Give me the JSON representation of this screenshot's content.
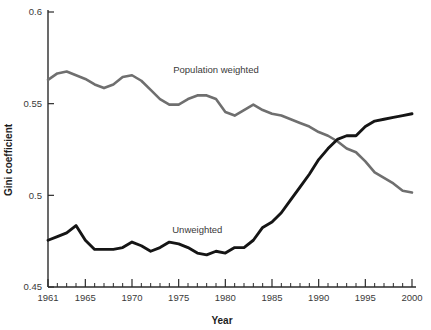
{
  "chart_data": {
    "type": "line",
    "title": "",
    "xlabel": "Year",
    "ylabel": "Gini coefficient",
    "xlim": [
      1961,
      2000
    ],
    "ylim": [
      0.45,
      0.6
    ],
    "grid": false,
    "legend_position": "inline-annotation",
    "y_ticks": [
      "0.45",
      "0.5",
      "0.55",
      "0.6"
    ],
    "y_tick_values": [
      0.45,
      0.5,
      0.55,
      0.6
    ],
    "x_ticks": [
      "1961",
      "1965",
      "1970",
      "1975",
      "1980",
      "1985",
      "1990",
      "1995",
      "2000"
    ],
    "x_tick_values": [
      1961,
      1965,
      1970,
      1975,
      1980,
      1985,
      1990,
      1995,
      2000
    ],
    "x_minor_step": 1,
    "x": [
      1961,
      1962,
      1963,
      1964,
      1965,
      1966,
      1967,
      1968,
      1969,
      1970,
      1971,
      1972,
      1973,
      1974,
      1975,
      1976,
      1977,
      1978,
      1979,
      1980,
      1981,
      1982,
      1983,
      1984,
      1985,
      1986,
      1987,
      1988,
      1989,
      1990,
      1991,
      1992,
      1993,
      1994,
      1995,
      1996,
      1997,
      1998,
      1999,
      2000
    ],
    "series": [
      {
        "name": "Population weighted",
        "color": "#6f6f6f",
        "label_x": 1979,
        "label_y": 0.5665,
        "values": [
          0.563,
          0.5665,
          0.5675,
          0.5655,
          0.5635,
          0.5605,
          0.5585,
          0.5605,
          0.5645,
          0.5655,
          0.5625,
          0.5575,
          0.5525,
          0.5495,
          0.5495,
          0.5525,
          0.5545,
          0.5545,
          0.5525,
          0.5455,
          0.5435,
          0.5465,
          0.5495,
          0.5465,
          0.5445,
          0.5435,
          0.5415,
          0.5395,
          0.5375,
          0.5345,
          0.5325,
          0.5295,
          0.5255,
          0.5235,
          0.5185,
          0.5125,
          0.5095,
          0.5065,
          0.5025,
          0.5015
        ]
      },
      {
        "name": "Unweighted",
        "color": "#151515",
        "label_x": 1977,
        "label_y": 0.4795,
        "values": [
          0.4755,
          0.4775,
          0.4795,
          0.4835,
          0.4755,
          0.4705,
          0.4705,
          0.4705,
          0.4715,
          0.4745,
          0.4725,
          0.4695,
          0.4715,
          0.4745,
          0.4735,
          0.4715,
          0.4685,
          0.4675,
          0.4695,
          0.4685,
          0.4715,
          0.4715,
          0.4755,
          0.4825,
          0.4855,
          0.4905,
          0.4975,
          0.5045,
          0.5115,
          0.5195,
          0.5255,
          0.5305,
          0.5325,
          0.5325,
          0.5375,
          0.5405,
          0.5415,
          0.5425,
          0.5435,
          0.5445
        ]
      }
    ]
  },
  "axes": {
    "x_title": "Year",
    "y_title": "Gini coefficient"
  }
}
